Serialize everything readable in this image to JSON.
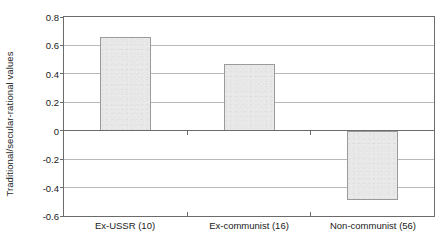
{
  "chart_data": {
    "type": "bar",
    "title": "",
    "xlabel": "",
    "ylabel": "Traditional/secular-rational values",
    "categories": [
      "Ex-USSR (10)",
      "Ex-communist (16)",
      "Non-communist (56)"
    ],
    "values": [
      0.66,
      0.47,
      -0.49
    ],
    "series": [
      {
        "name": "Traditional/secular-rational values",
        "values": [
          0.66,
          0.47,
          -0.49
        ]
      }
    ],
    "ylim": [
      -0.6,
      0.8
    ],
    "ytick_values": [
      0.8,
      0.6,
      0.4,
      0.2,
      0,
      -0.2,
      -0.4,
      -0.6
    ],
    "ytick_labels": [
      "0.8",
      "0.6",
      "0.4",
      "0.2",
      "0",
      "-0.2",
      "-0.4",
      "-0.6"
    ],
    "grid": true,
    "legend": "none",
    "bar_fill_color": "#e9e9e9",
    "bar_border_color": "#9a9a9a",
    "axis_color": "#6b6b6b",
    "gridline_color": "#b9b9b9",
    "text_color": "#1a1a1a",
    "background_color": "#ffffff"
  }
}
